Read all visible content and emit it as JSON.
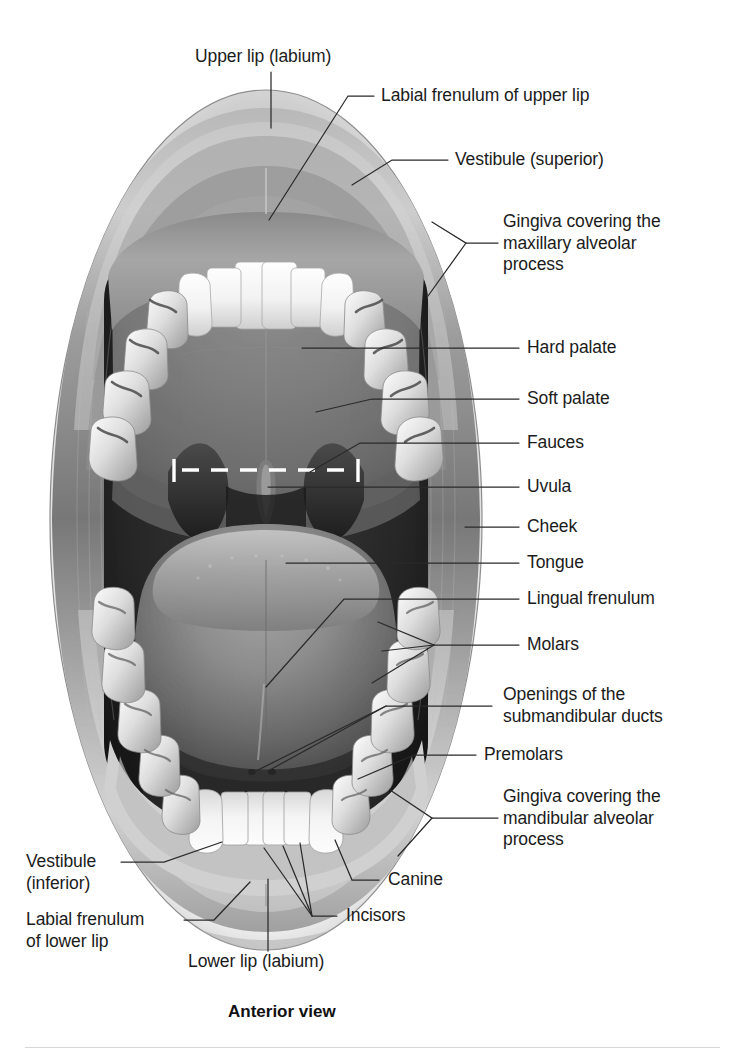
{
  "figure": {
    "caption": "Anterior view",
    "view_label": "Anterior view"
  },
  "labels": {
    "upper_lip": "Upper lip (labium)",
    "labial_frenulum_upper": "Labial frenulum of upper lip",
    "vestibule_superior": "Vestibule (superior)",
    "gingiva_maxillary_l1": "Gingiva covering the",
    "gingiva_maxillary_l2": "maxillary alveolar",
    "gingiva_maxillary_l3": "process",
    "hard_palate": "Hard palate",
    "soft_palate": "Soft palate",
    "fauces": "Fauces",
    "uvula": "Uvula",
    "cheek": "Cheek",
    "tongue": "Tongue",
    "lingual_frenulum": "Lingual frenulum",
    "molars": "Molars",
    "openings_ducts_l1": "Openings of the",
    "openings_ducts_l2": "submandibular ducts",
    "premolars": "Premolars",
    "gingiva_mandibular_l1": "Gingiva covering the",
    "gingiva_mandibular_l2": "mandibular alveolar",
    "gingiva_mandibular_l3": "process",
    "canine": "Canine",
    "incisors": "Incisors",
    "vestibule_inferior_l1": "Vestibule",
    "vestibule_inferior_l2": "(inferior)",
    "labial_frenulum_lower_l1": "Labial frenulum",
    "labial_frenulum_lower_l2": "of lower lip",
    "lower_lip": "Lower lip (labium)"
  },
  "colors": {
    "text": "#1b1b1b",
    "leader_line": "#2a2a2a",
    "marker_white": "#ffffff",
    "rule": "#d8d8d8",
    "background": "#ffffff"
  },
  "markers": {
    "fauces_indicator": "dashed-white-line-with-end-ticks"
  }
}
